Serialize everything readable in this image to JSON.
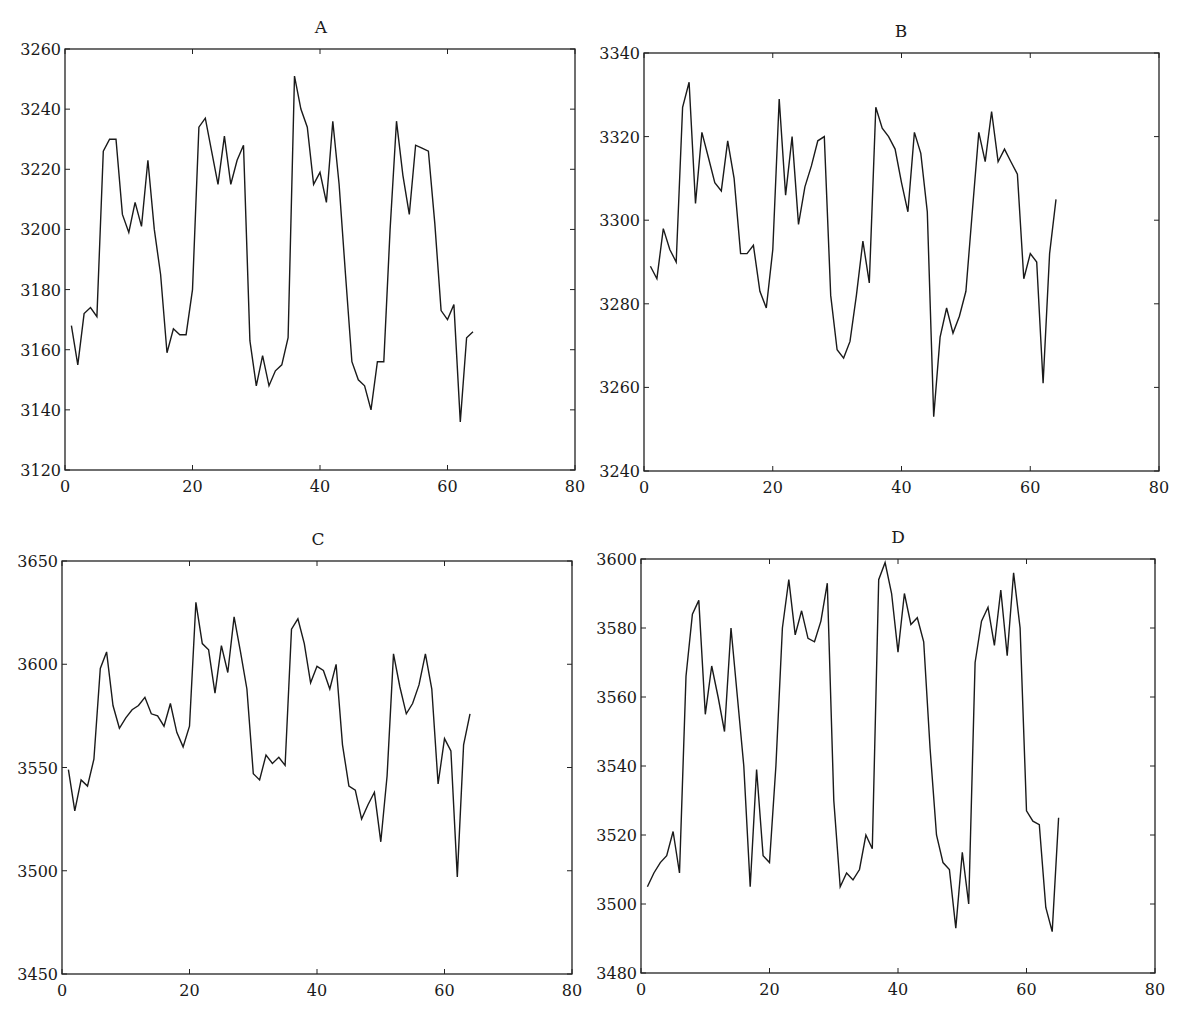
{
  "chart_data": [
    {
      "type": "line",
      "title": "A",
      "xlabel": "",
      "ylabel": "",
      "xlim": [
        0,
        80
      ],
      "ylim": [
        3120,
        3260
      ],
      "xticks": [
        0,
        20,
        40,
        60,
        80
      ],
      "yticks": [
        3120,
        3140,
        3160,
        3180,
        3200,
        3220,
        3240,
        3260
      ],
      "grid": false,
      "legend": null,
      "x_start": 1,
      "series": [
        {
          "name": "A",
          "values": [
            3168,
            3155,
            3172,
            3174,
            3171,
            3226,
            3230,
            3230,
            3205,
            3199,
            3209,
            3201,
            3223,
            3200,
            3185,
            3159,
            3167,
            3165,
            3165,
            3180,
            3234,
            3237,
            3226,
            3215,
            3231,
            3215,
            3223,
            3228,
            3163,
            3148,
            3158,
            3148,
            3153,
            3155,
            3164,
            3251,
            3240,
            3234,
            3215,
            3219,
            3209,
            3236,
            3215,
            3185,
            3156,
            3150,
            3148,
            3140,
            3156,
            3156,
            3200,
            3236,
            3218,
            3205,
            3228,
            3227,
            3226,
            3202,
            3173,
            3170,
            3175,
            3136,
            3164,
            3166
          ]
        }
      ]
    },
    {
      "type": "line",
      "title": "B",
      "xlabel": "",
      "ylabel": "",
      "xlim": [
        0,
        80
      ],
      "ylim": [
        3240,
        3340
      ],
      "xticks": [
        0,
        20,
        40,
        60,
        80
      ],
      "yticks": [
        3240,
        3260,
        3280,
        3300,
        3320,
        3340
      ],
      "grid": false,
      "legend": null,
      "x_start": 1,
      "series": [
        {
          "name": "B",
          "values": [
            3289,
            3286,
            3298,
            3293,
            3290,
            3327,
            3333,
            3304,
            3321,
            3315,
            3309,
            3307,
            3319,
            3310,
            3292,
            3292,
            3294,
            3283,
            3279,
            3293,
            3329,
            3306,
            3320,
            3299,
            3308,
            3313,
            3319,
            3320,
            3282,
            3269,
            3267,
            3271,
            3282,
            3295,
            3285,
            3327,
            3322,
            3320,
            3317,
            3309,
            3302,
            3321,
            3316,
            3302,
            3253,
            3272,
            3279,
            3273,
            3277,
            3283,
            3302,
            3321,
            3314,
            3326,
            3314,
            3317,
            3314,
            3311,
            3286,
            3292,
            3290,
            3261,
            3292,
            3305
          ]
        }
      ]
    },
    {
      "type": "line",
      "title": "C",
      "xlabel": "",
      "ylabel": "",
      "xlim": [
        0,
        80
      ],
      "ylim": [
        3450,
        3650
      ],
      "xticks": [
        0,
        20,
        40,
        60,
        80
      ],
      "yticks": [
        3450,
        3500,
        3550,
        3600,
        3650
      ],
      "grid": false,
      "legend": null,
      "x_start": 1,
      "series": [
        {
          "name": "C",
          "values": [
            3549,
            3529,
            3544,
            3541,
            3554,
            3598,
            3606,
            3580,
            3569,
            3574,
            3578,
            3580,
            3584,
            3576,
            3575,
            3570,
            3581,
            3567,
            3560,
            3570,
            3630,
            3610,
            3607,
            3586,
            3609,
            3596,
            3623,
            3606,
            3588,
            3547,
            3544,
            3556,
            3552,
            3555,
            3551,
            3617,
            3622,
            3610,
            3591,
            3599,
            3597,
            3588,
            3600,
            3561,
            3541,
            3539,
            3525,
            3532,
            3538,
            3514,
            3546,
            3605,
            3589,
            3576,
            3581,
            3590,
            3605,
            3588,
            3542,
            3564,
            3558,
            3497,
            3561,
            3576
          ]
        }
      ]
    },
    {
      "type": "line",
      "title": "D",
      "xlabel": "",
      "ylabel": "",
      "xlim": [
        0,
        80
      ],
      "ylim": [
        3480,
        3600
      ],
      "xticks": [
        0,
        20,
        40,
        60,
        80
      ],
      "yticks": [
        3480,
        3500,
        3520,
        3540,
        3560,
        3580,
        3600
      ],
      "grid": false,
      "legend": null,
      "x_start": 1,
      "series": [
        {
          "name": "D",
          "values": [
            3505,
            3509,
            3512,
            3514,
            3521,
            3509,
            3566,
            3584,
            3588,
            3555,
            3569,
            3560,
            3550,
            3580,
            3560,
            3540,
            3505,
            3539,
            3514,
            3512,
            3540,
            3580,
            3594,
            3578,
            3585,
            3577,
            3576,
            3582,
            3593,
            3530,
            3505,
            3509,
            3507,
            3510,
            3520,
            3516,
            3594,
            3599,
            3590,
            3573,
            3590,
            3581,
            3583,
            3576,
            3545,
            3520,
            3512,
            3510,
            3493,
            3515,
            3500,
            3570,
            3582,
            3586,
            3575,
            3591,
            3572,
            3596,
            3580,
            3527,
            3524,
            3523,
            3499,
            3492,
            3525
          ]
        }
      ]
    }
  ],
  "style": {
    "line_color": "#1a1a1a",
    "axis_color": "#222222",
    "background": "#ffffff"
  }
}
